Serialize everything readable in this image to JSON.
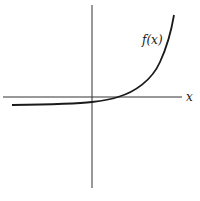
{
  "diagram": {
    "curve_label": "f(x)",
    "x_axis_label": "x",
    "colors": {
      "ink": "#1a1a1a",
      "background": "#ffffff"
    }
  }
}
